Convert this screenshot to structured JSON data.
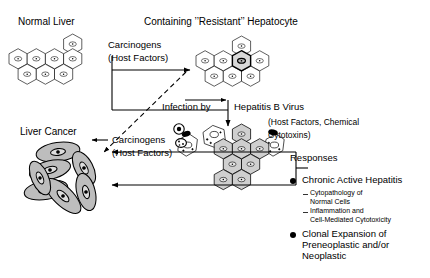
{
  "figure": {
    "type": "biomedical-flow-diagram"
  },
  "labels": {
    "normal_liver": "Normal Liver",
    "containing_resistant": "Containing ’’Resistant’’ Hepatocyte",
    "carcinogens_top": "Carcinogens",
    "host_factors_top": "(Host Factors)",
    "infection_by": "Infection by",
    "hepatitis_b_virus": "Hepatitis B Virus",
    "host_factors_chemical": "(Host Factors, Chemical",
    "cytotoxins": "Cytotoxins)",
    "responses": "Responses",
    "liver_cancer": "Liver Cancer",
    "carcinogens_mid": "Carcinogens",
    "host_factors_mid": "(Host Factors)"
  },
  "responses": {
    "heading": "Responses",
    "items": [
      {
        "label": "Chronic Active Hepatitis",
        "sub": [
          "Cytopathology of\nNormal Cells",
          "Inflammation and\nCell-Mediated Cytotoxicity"
        ]
      },
      {
        "label": "Clonal Expansion of\nPreneoplastic and/or\nNeoplastic",
        "sub": []
      }
    ]
  },
  "cell_clusters": [
    {
      "name": "normal-liver-cluster",
      "description": "hexagonal hepatocytes, white fill, thin outline",
      "cell_count": 8,
      "fill": "#ffffff"
    },
    {
      "name": "resistant-hepatocyte-cluster",
      "description": "hexagonal hepatocytes with one bold-outlined resistant cell",
      "cell_count": 8,
      "fill": "#ffffff",
      "resistant_fill": "#d8d8d8"
    },
    {
      "name": "infected-hepatocyte-cluster",
      "description": "grey-shaded infected hexagonal cells with damaged stippled cells and virus particles",
      "cell_count": 8,
      "fill": "#cfcfcf"
    },
    {
      "name": "liver-cancer-cluster",
      "description": "elongated grey oval neoplastic cells",
      "cell_count": 7,
      "fill": "#b8b8b8"
    }
  ],
  "colors": {
    "stroke": "#000000",
    "cell_white": "#ffffff",
    "cell_grey": "#cfcfcf",
    "cancer_grey": "#b5b5b5",
    "background": "#ffffff"
  }
}
